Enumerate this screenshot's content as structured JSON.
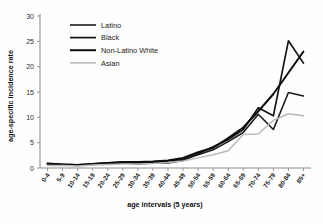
{
  "chart_data": {
    "type": "line",
    "title": "",
    "xlabel": "age intervals (5 years)",
    "ylabel": "age-specific incidence rate",
    "ylim": [
      0,
      30
    ],
    "yticks": [
      0,
      5,
      10,
      15,
      20,
      25,
      30
    ],
    "grid": false,
    "legend_position": "top-left-inside",
    "categories": [
      "0-4",
      "5-9",
      "10-14",
      "15-19",
      "20-24",
      "25-29",
      "30-34",
      "35-39",
      "40-44",
      "45-49",
      "50-54",
      "55-59",
      "60-64",
      "65-69",
      "70-74",
      "75-79",
      "80-84",
      "85+"
    ],
    "series": [
      {
        "name": "Latino",
        "color": "#1a1a1a",
        "width": 1.6,
        "values": [
          0.9,
          0.6,
          0.5,
          0.7,
          0.9,
          1.0,
          1.1,
          1.2,
          1.4,
          1.7,
          2.6,
          3.6,
          5.2,
          7.0,
          10.6,
          7.6,
          14.9,
          14.2
        ]
      },
      {
        "name": "Black",
        "color": "#141414",
        "width": 1.7,
        "values": [
          0.8,
          0.7,
          0.6,
          0.8,
          1.0,
          1.1,
          0.8,
          1.0,
          1.0,
          1.5,
          2.8,
          4.2,
          5.6,
          7.6,
          11.9,
          10.3,
          25.1,
          20.7
        ]
      },
      {
        "name": "Non-Latino White",
        "color": "#0d0d0d",
        "width": 2.0,
        "values": [
          0.9,
          0.7,
          0.6,
          0.8,
          1.0,
          1.2,
          1.2,
          1.3,
          1.5,
          2.0,
          3.1,
          4.0,
          5.9,
          8.0,
          11.2,
          14.6,
          18.8,
          23.0
        ]
      },
      {
        "name": "Asian",
        "color": "#b9b9b9",
        "width": 1.5,
        "values": [
          0.5,
          0.5,
          0.4,
          0.6,
          0.7,
          0.8,
          0.8,
          0.9,
          1.1,
          1.4,
          2.0,
          2.6,
          3.4,
          6.6,
          6.7,
          9.4,
          10.7,
          10.3
        ]
      }
    ]
  },
  "legend": {
    "items": [
      {
        "label": "Latino"
      },
      {
        "label": "Black"
      },
      {
        "label": "Non-Latino White"
      },
      {
        "label": "Asian"
      }
    ]
  }
}
